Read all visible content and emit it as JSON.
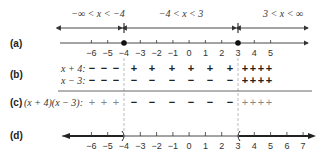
{
  "parts": {
    "a": "(a)",
    "b": "(b)",
    "c": "(c)",
    "d": "(d)"
  },
  "intervals": [
    {
      "label": "−∞ < x < −4"
    },
    {
      "label": "−4 < x < 3"
    },
    {
      "label": "3 < x < ∞"
    }
  ],
  "critical_points": [
    -4,
    3
  ],
  "number_line_a": {
    "ticks": [
      "−6",
      "−5",
      "−4",
      "−3",
      "−2",
      "−1",
      "0",
      "1",
      "2",
      "3",
      "4",
      "5"
    ],
    "tick_values": [
      -6,
      -5,
      -4,
      -3,
      -2,
      -1,
      0,
      1,
      2,
      3,
      4,
      5
    ]
  },
  "sign_chart": {
    "factor1_label": "x + 4:",
    "factor2_label": "x − 3:",
    "product_label": "(x + 4)(x − 3):",
    "factor1_signs": {
      "left": [
        "−",
        "−",
        "−"
      ],
      "middle": [
        "+",
        "+",
        "+",
        "+",
        "+",
        "+"
      ],
      "right": [
        "+",
        "+",
        "+",
        "+"
      ]
    },
    "factor2_signs": {
      "left": [
        "−",
        "−",
        "−"
      ],
      "middle": [
        "−",
        "−",
        "−",
        "−",
        "−",
        "−"
      ],
      "right": [
        "+",
        "+",
        "+",
        "+"
      ]
    },
    "product_signs": {
      "left": [
        "+",
        "+",
        "+"
      ],
      "middle": [
        "−",
        "−",
        "−",
        "−",
        "−",
        "−"
      ],
      "right": [
        "+",
        "+",
        "+",
        "+"
      ]
    }
  },
  "number_line_d": {
    "ticks": [
      "−6",
      "−5",
      "−4",
      "−3",
      "−2",
      "−1",
      "0",
      "1",
      "2",
      "3",
      "4",
      "5",
      "6",
      "7"
    ],
    "tick_values": [
      -6,
      -5,
      -4,
      -3,
      -2,
      -1,
      0,
      1,
      2,
      3,
      4,
      5,
      6,
      7
    ],
    "solution": "x < −4 or x > 3"
  },
  "colors": {
    "line": "#333333",
    "dashed": "#aaaaaa",
    "light_sign": "#888888"
  }
}
